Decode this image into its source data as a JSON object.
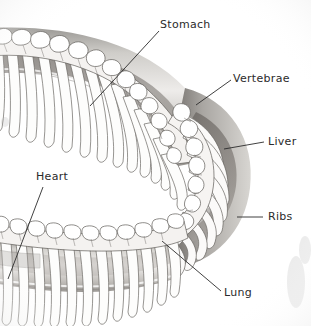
{
  "figure": {
    "style": "grayscale pencil illustration",
    "background_color": "#ffffff",
    "ink_color": "#2b2b2b",
    "bone_color": "#ffffff",
    "body_shadow_color": "#8d8d8d",
    "deep_shadow_color": "#55504c"
  },
  "labels": [
    {
      "id": "stomach",
      "text": "Stomach",
      "text_x": 160,
      "text_y": 28,
      "anchor": "start",
      "leader": "M 159 31 L 90 106"
    },
    {
      "id": "vertebrae",
      "text": "Vertebrae",
      "text_x": 233,
      "text_y": 82,
      "anchor": "start",
      "leader": "M 231 80 L 196 105"
    },
    {
      "id": "liver",
      "text": "Liver",
      "text_x": 268,
      "text_y": 145,
      "anchor": "start",
      "leader": "M 264 142 L 224 149"
    },
    {
      "id": "ribs",
      "text": "Ribs",
      "text_x": 268,
      "text_y": 220,
      "anchor": "start",
      "leader": "M 263 217 L 237 217"
    },
    {
      "id": "heart",
      "text": "Heart",
      "text_x": 36,
      "text_y": 180,
      "anchor": "start",
      "leader": "M 43 187 L 8 279"
    },
    {
      "id": "lung",
      "text": "Lung",
      "text_x": 224,
      "text_y": 296,
      "anchor": "start",
      "leader": "M 221 291 L 162 241"
    }
  ],
  "anatomy_parts": [
    "vertebral-column",
    "neural-spines",
    "ribs",
    "body-wall",
    "stomach-region",
    "liver-region",
    "lung-region",
    "heart-region"
  ]
}
